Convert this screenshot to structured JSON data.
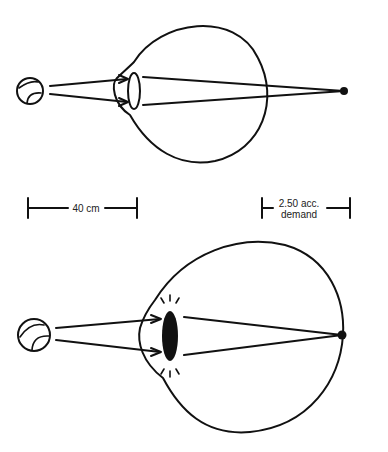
{
  "figure": {
    "title": "",
    "top_diagram": {
      "name": "relaxed-eye",
      "description": "Unaccommodated eye: object at near distance focuses behind the retina",
      "lens_state": "relaxed"
    },
    "scale_bars": {
      "distance_label": "40 cm",
      "demand_label_line1": "2.50 acc.",
      "demand_label_line2": "demand"
    },
    "bottom_diagram": {
      "name": "accommodated-eye",
      "description": "Accommodating eye: thickened lens focuses image on the retina",
      "lens_state": "accommodated"
    },
    "colors": {
      "line": "#111111",
      "background": "#ffffff"
    }
  }
}
